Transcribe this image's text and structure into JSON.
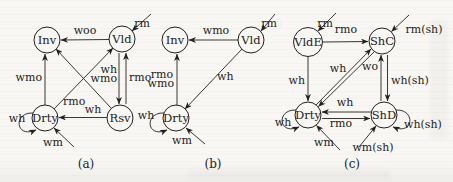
{
  "figure": {
    "kind": "state-transition-diagrams",
    "colors": {
      "background": "#f8f7f4",
      "ink": "#22211f"
    },
    "diagrams": [
      {
        "id": "a",
        "caption": "(a)",
        "caption_x": 86,
        "caption_y": 168,
        "states": [
          {
            "label": "Inv",
            "x": 47,
            "y": 40,
            "r": 13
          },
          {
            "label": "Vld",
            "x": 122,
            "y": 39,
            "r": 13
          },
          {
            "label": "Drty",
            "x": 45,
            "y": 118,
            "r": 13
          },
          {
            "label": "Rsv",
            "x": 120,
            "y": 118,
            "r": 13
          }
        ],
        "transitions": [
          {
            "from": "Vld",
            "to": "Inv",
            "line": [
              109,
              39.5,
              61,
              40
            ],
            "labels": [
              {
                "text": "woo",
                "x": 85,
                "y": 34,
                "anchor": "middle"
              }
            ]
          },
          {
            "from": "outside",
            "to": "Vld",
            "line": [
              151,
              14,
              132,
              31
            ],
            "labels": [
              {
                "text": "rm",
                "x": 142,
                "y": 27,
                "anchor": "middle"
              }
            ]
          },
          {
            "from": "Drty",
            "to": "Inv",
            "line": [
              45,
              105,
              45,
              54
            ],
            "labels": [
              {
                "text": "wmo",
                "x": 42,
                "y": 81,
                "anchor": "end"
              }
            ]
          },
          {
            "from": "Vld",
            "to": "Rsv",
            "line": [
              119,
              53,
              119,
              104
            ],
            "labels": [
              {
                "text": "wh",
                "x": 117,
                "y": 73,
                "anchor": "end"
              },
              {
                "text": "wmo",
                "x": 117,
                "y": 82,
                "anchor": "end"
              }
            ]
          },
          {
            "from": "Rsv",
            "to": "Vld",
            "line": [
              126,
              104,
              126,
              53
            ],
            "labels": [
              {
                "text": "rmo",
                "x": 129,
                "y": 81,
                "anchor": "start"
              }
            ]
          },
          {
            "from": "Drty",
            "to": "Vld",
            "line": [
              54,
              109,
              113,
              48
            ],
            "labels": [
              {
                "text": "rmo",
                "x": 63,
                "y": 105,
                "anchor": "start"
              }
            ]
          },
          {
            "from": "Rsv",
            "to": "Inv",
            "line": [
              111,
              108,
              56,
              49
            ],
            "labels": []
          },
          {
            "from": "Rsv",
            "to": "Drty",
            "line": [
              107,
              117.5,
              59,
              117.5
            ],
            "labels": [
              {
                "text": "wh",
                "x": 93,
                "y": 113,
                "anchor": "middle"
              }
            ]
          },
          {
            "from": "Drty",
            "to": "Drty",
            "path": "M 33,113 C 13,112 15,139 36,130",
            "labels": [
              {
                "text": "wh",
                "x": 17,
                "y": 122,
                "anchor": "middle"
              }
            ]
          },
          {
            "from": "outside",
            "to": "Drty",
            "line": [
              74,
              147,
              54,
              128
            ],
            "labels": [
              {
                "text": "wm",
                "x": 53,
                "y": 146,
                "anchor": "middle"
              }
            ]
          }
        ]
      },
      {
        "id": "b",
        "caption": "(b)",
        "caption_x": 213,
        "caption_y": 168,
        "states": [
          {
            "label": "Inv",
            "x": 175,
            "y": 40,
            "r": 13
          },
          {
            "label": "Vld",
            "x": 251,
            "y": 40,
            "r": 13
          },
          {
            "label": "Drty",
            "x": 176,
            "y": 118,
            "r": 13
          }
        ],
        "transitions": [
          {
            "from": "Vld",
            "to": "Inv",
            "line": [
              238,
              40,
              189,
              40
            ],
            "labels": [
              {
                "text": "wmo",
                "x": 216,
                "y": 34,
                "anchor": "middle"
              }
            ]
          },
          {
            "from": "outside",
            "to": "Vld",
            "line": [
              275,
              14,
              261,
              31
            ],
            "labels": [
              {
                "text": "rm",
                "x": 269,
                "y": 27,
                "anchor": "middle"
              }
            ]
          },
          {
            "from": "Drty",
            "to": "Inv",
            "line": [
              177,
              105,
              177,
              54
            ],
            "labels": [
              {
                "text": "rmo",
                "x": 173,
                "y": 78,
                "anchor": "end"
              },
              {
                "text": "wmo",
                "x": 174,
                "y": 87,
                "anchor": "end"
              }
            ]
          },
          {
            "from": "Vld",
            "to": "Drty",
            "line": [
              242,
              49,
              185,
              109
            ],
            "labels": [
              {
                "text": "wh",
                "x": 217,
                "y": 80,
                "anchor": "start"
              }
            ]
          },
          {
            "from": "Drty",
            "to": "Drty",
            "path": "M 164,113 C 144,112 146,139 167,130",
            "labels": [
              {
                "text": "wh",
                "x": 146,
                "y": 119,
                "anchor": "middle"
              }
            ]
          },
          {
            "from": "outside",
            "to": "Drty",
            "line": [
              205,
              144,
              186,
              128
            ],
            "labels": [
              {
                "text": "wm",
                "x": 182,
                "y": 144,
                "anchor": "middle"
              }
            ]
          }
        ]
      },
      {
        "id": "c",
        "caption": "(c)",
        "caption_x": 352,
        "caption_y": 168,
        "states": [
          {
            "label": "VldE",
            "x": 308,
            "y": 42,
            "r": 14.5
          },
          {
            "label": "ShC",
            "x": 382,
            "y": 41,
            "r": 13
          },
          {
            "label": "Drty",
            "x": 308,
            "y": 115,
            "r": 13
          },
          {
            "label": "ShD",
            "x": 384,
            "y": 115,
            "r": 13
          }
        ],
        "transitions": [
          {
            "from": "outside",
            "to": "VldE",
            "line": [
              336,
              13,
              318,
              31
            ],
            "labels": [
              {
                "text": "rm",
                "x": 325,
                "y": 27,
                "anchor": "middle"
              }
            ]
          },
          {
            "from": "VldE",
            "to": "ShC",
            "line": [
              323,
              42,
              368,
              41.5
            ],
            "labels": [
              {
                "text": "rmo",
                "x": 346,
                "y": 33,
                "anchor": "middle"
              }
            ]
          },
          {
            "from": "outside",
            "to": "ShC",
            "line": [
              409,
              15,
              391.5,
              31.5
            ],
            "labels": [
              {
                "text": "rm(sh)",
                "x": 424,
                "y": 33,
                "anchor": "middle"
              }
            ]
          },
          {
            "from": "VldE",
            "to": "Drty",
            "line": [
              308,
              57,
              308,
              101
            ],
            "labels": [
              {
                "text": "wh",
                "x": 305,
                "y": 84,
                "anchor": "end"
              }
            ]
          },
          {
            "from": "Drty",
            "to": "ShC",
            "line": [
              316,
              105,
              371,
              49
            ],
            "labels": [
              {
                "text": "wh",
                "x": 338,
                "y": 72,
                "anchor": "middle"
              }
            ]
          },
          {
            "from": "ShC",
            "to": "Drty",
            "line": [
              374,
              52,
              318.5,
              106.5
            ],
            "labels": [
              {
                "text": "wo",
                "x": 370,
                "y": 70,
                "anchor": "middle"
              }
            ]
          },
          {
            "from": "ShD",
            "to": "ShC",
            "line": [
              381,
              101,
              381,
              55
            ],
            "labels": []
          },
          {
            "from": "ShC",
            "to": "ShD",
            "line": [
              387.5,
              55,
              387.5,
              101
            ],
            "labels": [
              {
                "text": "wh(sh)",
                "x": 391,
                "y": 84,
                "anchor": "start"
              }
            ]
          },
          {
            "from": "ShD",
            "to": "Drty",
            "line": [
              371,
              112,
              322,
              112
            ],
            "labels": [
              {
                "text": "wh",
                "x": 345,
                "y": 106,
                "anchor": "middle"
              }
            ]
          },
          {
            "from": "Drty",
            "to": "ShD",
            "line": [
              322,
              118.5,
              370,
              118.5
            ],
            "labels": [
              {
                "text": "rmo",
                "x": 341,
                "y": 127,
                "anchor": "middle"
              }
            ]
          },
          {
            "from": "Drty",
            "to": "Drty",
            "path": "M 296,110 C 276,109 278,136 299,127",
            "labels": [
              {
                "text": "wh",
                "x": 283,
                "y": 126,
                "anchor": "middle"
              }
            ]
          },
          {
            "from": "outside",
            "to": "Drty",
            "line": [
              340,
              150,
              316.5,
              125.5
            ],
            "labels": [
              {
                "text": "wm",
                "x": 324,
                "y": 146,
                "anchor": "middle"
              }
            ]
          },
          {
            "from": "ShD",
            "to": "ShD",
            "path": "M 396,110 C 416,109 414,136 393,127",
            "labels": [
              {
                "text": "wh(sh)",
                "x": 404,
                "y": 128,
                "anchor": "start"
              }
            ]
          },
          {
            "from": "outside",
            "to": "ShD",
            "line": [
              359,
              147,
              376,
              126
            ],
            "labels": [
              {
                "text": "wm(sh)",
                "x": 373,
                "y": 151,
                "anchor": "middle"
              }
            ]
          }
        ]
      }
    ]
  }
}
